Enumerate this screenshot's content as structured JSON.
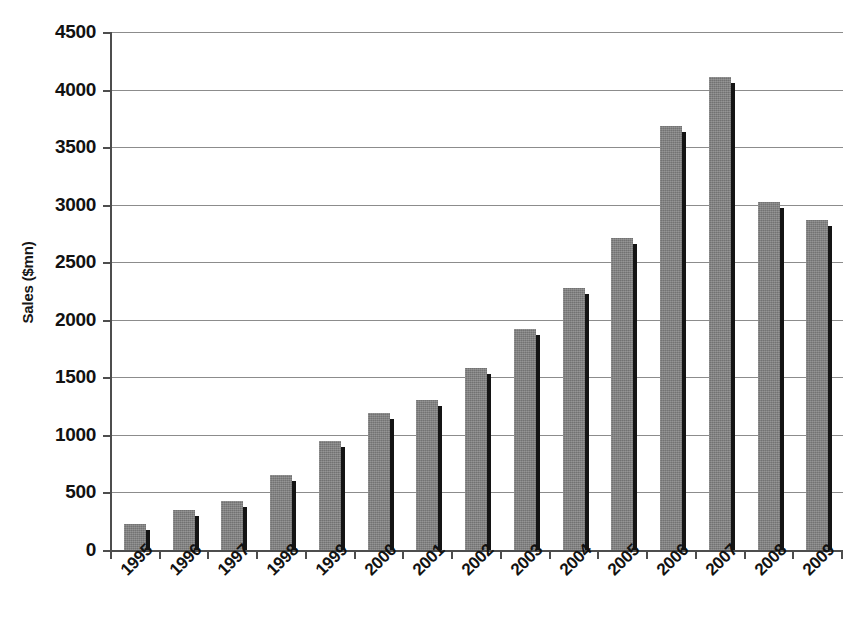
{
  "chart_data": {
    "type": "bar",
    "title": "",
    "xlabel": "",
    "ylabel": "Sales ($mn)",
    "categories": [
      "1995",
      "1996",
      "1997",
      "1998",
      "1999",
      "2000",
      "2001",
      "2002",
      "2003",
      "2004",
      "2005",
      "2006",
      "2007",
      "2008",
      "2009"
    ],
    "values": [
      225,
      350,
      430,
      650,
      950,
      1190,
      1300,
      1580,
      1920,
      2280,
      2710,
      3680,
      4110,
      3020,
      2870
    ],
    "ylim": [
      0,
      4500
    ],
    "y_ticks": [
      0,
      500,
      1000,
      1500,
      2000,
      2500,
      3000,
      3500,
      4000,
      4500
    ],
    "y_tick_labels": [
      "0",
      "500",
      "1000",
      "1500",
      "2000",
      "2500",
      "3000",
      "3500",
      "4000",
      "4500"
    ],
    "grid": "horizontal",
    "legend": "none",
    "series": [
      {
        "name": "Sales",
        "color": "#808080",
        "edge_color": "#141414",
        "values": [
          225,
          350,
          430,
          650,
          950,
          1190,
          1300,
          1580,
          1920,
          2280,
          2710,
          3680,
          4110,
          3020,
          2870
        ]
      }
    ],
    "x_tick_rotation": -45
  }
}
